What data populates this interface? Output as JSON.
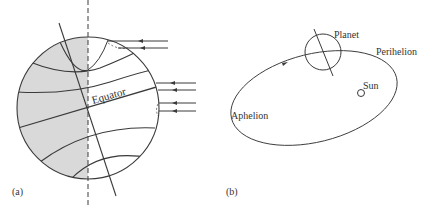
{
  "figure": {
    "panel_a": {
      "label": "(a)",
      "equator_label": "Equator",
      "description": "Planet globe with tilted rotation axis, latitude circles, dashed day/night terminator, night side shaded, parallel incoming sunlight rays from the right",
      "colors": {
        "night_shade": "#d9d9d9",
        "line": "#3a3a3a"
      }
    },
    "panel_b": {
      "label": "(b)",
      "planet_label": "Planet",
      "perihelion_label": "Perihelion",
      "sun_label": "Sun",
      "aphelion_label": "Aphelion",
      "description": "Elliptical orbit of planet around the Sun with tilted axis; planet near perihelion"
    }
  }
}
